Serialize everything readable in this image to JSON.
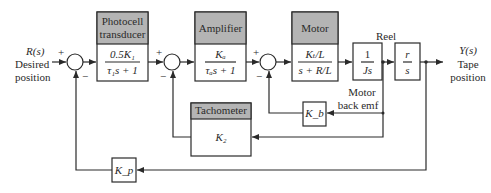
{
  "colors": {
    "line": "#2a2a2a",
    "header_fill": "#b4b4b4",
    "box_fill": "#ffffff"
  },
  "input": {
    "symbol": "R(s)",
    "line1": "Desired",
    "line2": "position"
  },
  "output": {
    "symbol": "Y(s)",
    "line1": "Tape",
    "line2": "position"
  },
  "blocks": {
    "photocell": {
      "title1": "Photocell",
      "title2": "transducer",
      "num": "0.5K₁",
      "den": "τ₁s + 1"
    },
    "amplifier": {
      "title": "Amplifier",
      "num": "Kₐ",
      "den": "τₐs + 1"
    },
    "motor": {
      "title": "Motor",
      "num": "Kₜ/L",
      "den": "s + R/L"
    },
    "inertia": {
      "num": "1",
      "den": "Js"
    },
    "reel": {
      "title": "Reel",
      "num": "r",
      "den": "s"
    },
    "tachometer": {
      "title": "Tachometer",
      "gain": "K₂"
    },
    "back_emf": {
      "gain": "K_b",
      "label1": "Motor",
      "label2": "back emf"
    },
    "position_feedback": {
      "gain": "K_p"
    }
  },
  "signs": {
    "plus": "+",
    "minus": "−"
  }
}
